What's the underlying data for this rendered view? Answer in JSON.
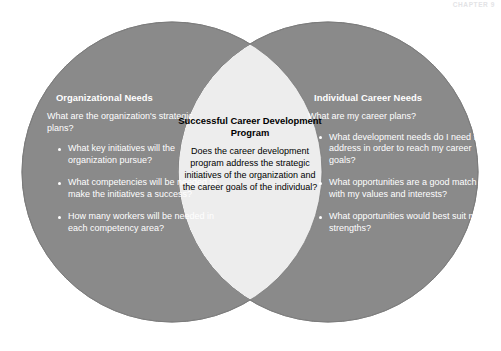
{
  "figure": {
    "kind": "venn-diagram",
    "watermark": "CHAPTER 9",
    "colors": {
      "circle_fill": "#8a8a8a",
      "overlap_fill": "#ededed",
      "circle_stroke": "#7d7d7d",
      "background": "#ffffff",
      "lobe_text": "#ffffff",
      "overlap_text": "#000000"
    }
  },
  "left_circle": {
    "title": "Organizational Needs",
    "lead": "What are the organization's strategic plans?",
    "bullets": [
      "What key initiatives will the organization pursue?",
      "What competencies will be needed to make the initiatives a success?",
      "How many workers will be needed in each competency area?"
    ]
  },
  "overlap": {
    "title": "Successful Career Development Program",
    "body": "Does the career development program address the strategic initiatives of the organization and the career goals of the individual?"
  },
  "right_circle": {
    "title": "Individual Career Needs",
    "lead": "What are my career plans?",
    "bullets": [
      "What development needs do I need to address in order to reach my career goals?",
      "What opportunities are a good match with my values and interests?",
      "What opportunities would best suit my strengths?"
    ]
  }
}
